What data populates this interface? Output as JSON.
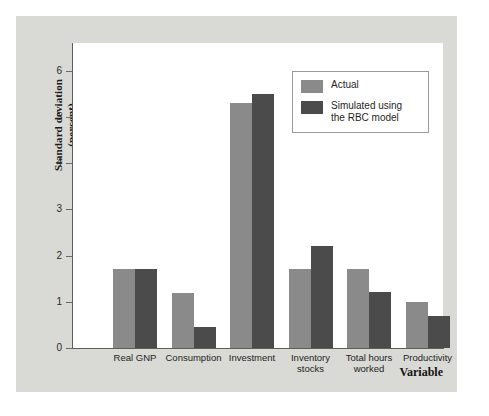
{
  "chart_data": {
    "type": "bar",
    "title": "",
    "xlabel": "Variable",
    "ylabel": "Standard deviation\n(percent)",
    "ylabel_line1": "Standard deviation",
    "ylabel_line2": "(percent)",
    "categories": [
      "Real GNP",
      "Consumption",
      "Investment",
      "Inventory stocks",
      "Total hours worked",
      "Productivity"
    ],
    "category_lines": [
      [
        "Real GNP"
      ],
      [
        "Consumption"
      ],
      [
        "Investment"
      ],
      [
        "Inventory",
        "stocks"
      ],
      [
        "Total hours",
        "worked"
      ],
      [
        "Productivity"
      ]
    ],
    "series": [
      {
        "name": "Actual",
        "color": "#8a8a8a",
        "values": [
          1.7,
          1.2,
          5.3,
          1.7,
          1.7,
          1.0
        ]
      },
      {
        "name": "Simulated using the RBC model",
        "color": "#4b4b4b",
        "values": [
          1.7,
          0.45,
          5.5,
          2.2,
          1.22,
          0.7
        ]
      }
    ],
    "ylim": [
      0,
      6.6
    ],
    "yticks": [
      0,
      1,
      2,
      3,
      4,
      5,
      6
    ],
    "ytick_labels": [
      "0",
      "1",
      "2",
      "3",
      "4",
      "5",
      "6"
    ],
    "grid": false,
    "legend_position": "top-right"
  },
  "legend": {
    "entries": [
      {
        "label": "Actual",
        "label_line1": "Actual",
        "label_line2": ""
      },
      {
        "label": "Simulated using the RBC model",
        "label_line1": "Simulated using",
        "label_line2": "the RBC model"
      }
    ]
  },
  "colors": {
    "panel_background": "#d9d9d5",
    "plot_background": "#ffffff",
    "axis": "#5d5d5d",
    "actual_bar": "#8a8a8a",
    "simulated_bar": "#4b4b4b",
    "legend_border": "#9a9a9a",
    "text": "#1f1f1f"
  }
}
